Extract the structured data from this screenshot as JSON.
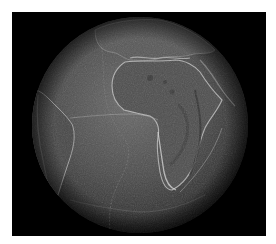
{
  "figure": {
    "background_color": "#000000",
    "page_color": "#ffffff",
    "globe": {
      "center_x": 140,
      "center_y": 125,
      "radius": 108,
      "ocean_color": "#4a4a4a",
      "land_color": "#505050",
      "highlight_color": "#bdbdbd",
      "shadow_color": "#1a1a1a"
    },
    "regions": [
      {
        "name": "Africa"
      },
      {
        "name": "South America"
      },
      {
        "name": "Europe"
      },
      {
        "name": "Arabian Peninsula"
      },
      {
        "name": "Atlantic Ocean"
      },
      {
        "name": "Mid-Atlantic Ridge"
      }
    ]
  }
}
